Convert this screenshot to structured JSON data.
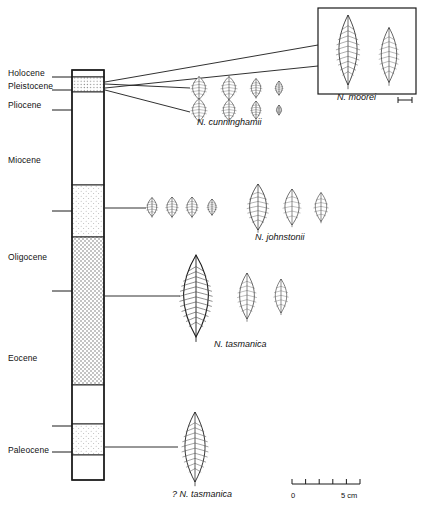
{
  "figure": {
    "type": "stratigraphic-column-with-leaf-fossils",
    "background": "#ffffff",
    "line_color": "#1a1a1a"
  },
  "column": {
    "label": "stratigraphic column",
    "x": 72,
    "y": 70,
    "width": 32,
    "height": 410,
    "epochs": [
      {
        "name": "Holocene",
        "label_y": 73,
        "tick_y": 77
      },
      {
        "name": "Pleistocene",
        "label_y": 86,
        "tick_y": 90
      },
      {
        "name": "Pliocene",
        "label_y": 105,
        "tick_y": 110
      },
      {
        "name": "Miocene",
        "label_y": 160,
        "tick_y": 211
      },
      {
        "name": "Oligocene",
        "label_y": 257,
        "tick_y": 291
      },
      {
        "name": "Eocene",
        "label_y": 358,
        "tick_y": 426
      },
      {
        "name": "Paleocene",
        "label_y": 450,
        "tick_y": 452
      }
    ],
    "bands": [
      {
        "name": "holocene-blank",
        "top": 70,
        "bottom": 77,
        "fill": "blank"
      },
      {
        "name": "pleistocene-stipple",
        "top": 77,
        "bottom": 92,
        "fill": "dots-fine"
      },
      {
        "name": "pliocene-miocene-blank",
        "top": 92,
        "bottom": 185,
        "fill": "blank"
      },
      {
        "name": "upper-oligocene-light",
        "top": 185,
        "bottom": 237,
        "fill": "dots-light"
      },
      {
        "name": "oligocene-eocene-dense",
        "top": 237,
        "bottom": 385,
        "fill": "dots-dense"
      },
      {
        "name": "eocene-blank",
        "top": 385,
        "bottom": 424,
        "fill": "blank"
      },
      {
        "name": "paleocene-light",
        "top": 424,
        "bottom": 455,
        "fill": "dots-light"
      },
      {
        "name": "base-blank",
        "top": 455,
        "bottom": 480,
        "fill": "blank"
      }
    ]
  },
  "groups": [
    {
      "id": "cunninghamii",
      "taxon": "N. cunninghamii",
      "taxon_x": 197,
      "taxon_y": 123,
      "rows": [
        {
          "y": 88,
          "leaves": [
            {
              "x": 199,
              "w": 19,
              "h": 23
            },
            {
              "x": 229,
              "w": 19,
              "h": 23
            },
            {
              "x": 256,
              "w": 14,
              "h": 19
            },
            {
              "x": 279,
              "w": 10,
              "h": 14
            }
          ]
        },
        {
          "y": 110,
          "leaves": [
            {
              "x": 199,
              "w": 19,
              "h": 23
            },
            {
              "x": 229,
              "w": 17,
              "h": 21
            },
            {
              "x": 256,
              "w": 13,
              "h": 18
            },
            {
              "x": 279,
              "w": 7,
              "h": 10
            }
          ]
        }
      ],
      "connectors": [
        {
          "x1": 105,
          "y1": 84,
          "x2": 190,
          "y2": 88
        },
        {
          "x1": 105,
          "y1": 90,
          "x2": 190,
          "y2": 112
        }
      ]
    },
    {
      "id": "johnstonii-small",
      "taxon": "",
      "rows": [
        {
          "y": 207,
          "leaves": [
            {
              "x": 152,
              "w": 14,
              "h": 19
            },
            {
              "x": 172,
              "w": 15,
              "h": 20
            },
            {
              "x": 192,
              "w": 15,
              "h": 20
            },
            {
              "x": 212,
              "w": 12,
              "h": 16
            }
          ]
        }
      ],
      "connectors": [
        {
          "x1": 105,
          "y1": 208,
          "x2": 146,
          "y2": 208
        }
      ]
    },
    {
      "id": "johnstonii",
      "taxon": "N. johnstonii",
      "taxon_x": 255,
      "taxon_y": 238,
      "rows": [
        {
          "y": 207,
          "leaves": [
            {
              "x": 258,
              "w": 25,
              "h": 46
            },
            {
              "x": 292,
              "w": 21,
              "h": 36
            },
            {
              "x": 321,
              "w": 17,
              "h": 29
            }
          ]
        }
      ],
      "connectors": []
    },
    {
      "id": "tasmanica",
      "taxon": "N. tasmanica",
      "taxon_x": 214,
      "taxon_y": 345,
      "rows": [
        {
          "y": 296,
          "leaves": [
            {
              "x": 196,
              "w": 37,
              "h": 82
            },
            {
              "x": 247,
              "w": 22,
              "h": 46
            },
            {
              "x": 281,
              "w": 17,
              "h": 34
            }
          ]
        }
      ],
      "connectors": [
        {
          "x1": 105,
          "y1": 296,
          "x2": 180,
          "y2": 296
        }
      ]
    },
    {
      "id": "tasmanica-query",
      "taxon": "? N. tasmanica",
      "taxon_x": 172,
      "taxon_y": 495,
      "rows": [
        {
          "y": 447,
          "leaves": [
            {
              "x": 195,
              "w": 30,
              "h": 70
            }
          ]
        }
      ],
      "connectors": [
        {
          "x1": 105,
          "y1": 447,
          "x2": 178,
          "y2": 447
        }
      ]
    }
  ],
  "inset": {
    "name": "N. moorei inset",
    "x": 318,
    "y": 8,
    "width": 98,
    "height": 86,
    "taxon": "N. moorei",
    "taxon_x": 337,
    "taxon_y": 98,
    "leaves": [
      {
        "x": 348,
        "y": 50,
        "w": 27,
        "h": 70
      },
      {
        "x": 389,
        "y": 55,
        "w": 23,
        "h": 55
      }
    ],
    "scalebar": {
      "x1": 398,
      "x2": 412,
      "y": 100
    },
    "connectors": [
      {
        "x1": 105,
        "y1": 82,
        "x2": 318,
        "y2": 45
      },
      {
        "x1": 105,
        "y1": 88,
        "x2": 318,
        "y2": 66
      }
    ]
  },
  "scalebar": {
    "name": "figure scale bar",
    "x": 292,
    "y": 484,
    "width": 68,
    "ticks": 6,
    "start_label": "0",
    "end_label": "5 cm",
    "start_label_x": 291,
    "end_label_x": 341,
    "label_y": 491
  }
}
